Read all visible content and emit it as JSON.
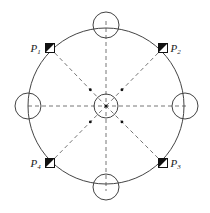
{
  "diagram": {
    "main_circle": {
      "cx": 106,
      "cy": 106,
      "r": 78
    },
    "center_circle": {
      "cx": 106,
      "cy": 106,
      "r": 12
    },
    "edge_circles": [
      {
        "name": "top",
        "cx": 106,
        "cy": 25,
        "r": 13
      },
      {
        "name": "right",
        "cx": 185,
        "cy": 106,
        "r": 13
      },
      {
        "name": "bottom",
        "cx": 106,
        "cy": 187,
        "r": 13
      },
      {
        "name": "left",
        "cx": 28,
        "cy": 106,
        "r": 13
      }
    ],
    "points": [
      {
        "label": "P",
        "sub": "1",
        "x": 50,
        "y": 48,
        "label_side": "left"
      },
      {
        "label": "P",
        "sub": "2",
        "x": 163,
        "y": 48,
        "label_side": "right"
      },
      {
        "label": "P",
        "sub": "3",
        "x": 163,
        "y": 163,
        "label_side": "right"
      },
      {
        "label": "P",
        "sub": "4",
        "x": 50,
        "y": 163,
        "label_side": "left"
      }
    ],
    "colors": {
      "line": "#444444",
      "dash": "#666666",
      "fill": "#111111"
    }
  }
}
